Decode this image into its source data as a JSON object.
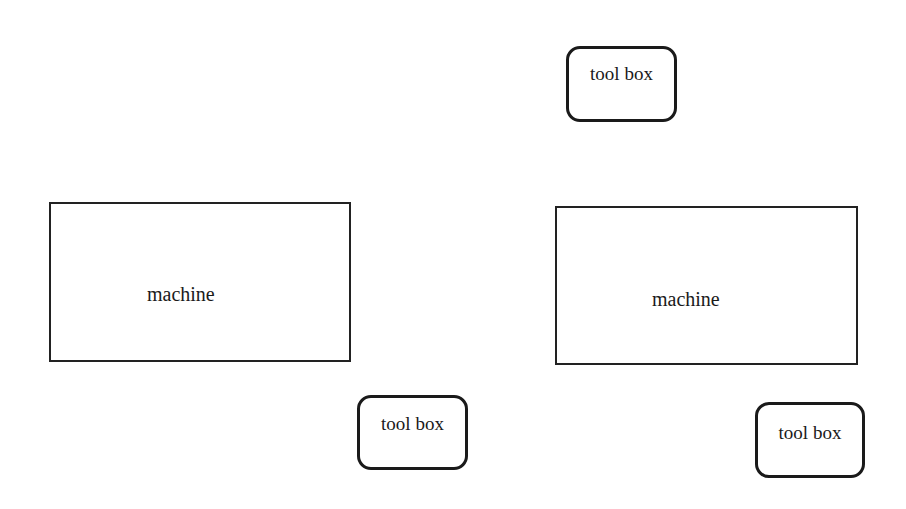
{
  "diagram": {
    "machines": [
      {
        "label": "machine"
      },
      {
        "label": "machine"
      }
    ],
    "toolboxes": [
      {
        "label": "tool box"
      },
      {
        "label": "tool box"
      },
      {
        "label": "tool box"
      }
    ]
  }
}
